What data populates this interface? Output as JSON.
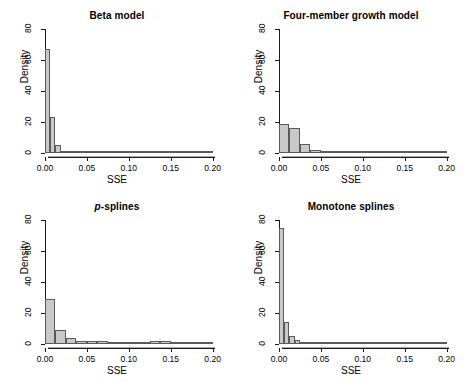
{
  "figure": {
    "panels": [
      {
        "id": "beta-model",
        "title": "Beta model",
        "title_italic_prefix": "",
        "xlabel": "SSE",
        "ylabel": "Density"
      },
      {
        "id": "four-member-growth-model",
        "title": "Four-member growth model",
        "title_italic_prefix": "",
        "xlabel": "SSE",
        "ylabel": "Density"
      },
      {
        "id": "p-splines",
        "title": "-splines",
        "title_italic_prefix": "p",
        "xlabel": "SSE",
        "ylabel": "Density"
      },
      {
        "id": "monotone-splines",
        "title": "Monotone splines",
        "title_italic_prefix": "",
        "xlabel": "SSE",
        "ylabel": "Density"
      }
    ],
    "axis": {
      "xticks": [
        0.0,
        0.05,
        0.1,
        0.15,
        0.2
      ],
      "xtick_labels": [
        "0.00",
        "0.05",
        "0.10",
        "0.15",
        "0.20"
      ],
      "yticks": [
        0,
        20,
        40,
        60,
        80
      ],
      "ytick_labels": [
        "0",
        "20",
        "40",
        "60",
        "80"
      ],
      "xlim": [
        0.0,
        0.21
      ],
      "ylim": [
        0,
        80
      ]
    },
    "colors": {
      "bar_fill": "#c9c9c9",
      "bar_border": "#5a5a5a",
      "axis": "#1a1a1a",
      "text": "#000000",
      "background": "#ffffff"
    }
  },
  "chart_data": [
    {
      "type": "bar",
      "title": "Beta model",
      "xlabel": "SSE",
      "ylabel": "Density",
      "xlim": [
        0.0,
        0.21
      ],
      "ylim": [
        0,
        80
      ],
      "grid": false,
      "legend": false,
      "bin_width": 0.00625,
      "bin_edges": [
        0.0,
        0.00625,
        0.0125,
        0.01875,
        0.025,
        0.03125,
        0.0375,
        0.04375,
        0.05,
        0.05625,
        0.0625,
        0.06875,
        0.075,
        0.08125,
        0.0875,
        0.09375,
        0.1,
        0.10625,
        0.1125,
        0.11875,
        0.125,
        0.13125,
        0.1375,
        0.14375,
        0.15,
        0.15625,
        0.1625,
        0.16875,
        0.175,
        0.18125,
        0.1875,
        0.19375,
        0.2
      ],
      "values": [
        67,
        23,
        5,
        1.5,
        1,
        0.8,
        0.5,
        0.4,
        0.3,
        0.3,
        0.3,
        0.2,
        0.2,
        0.4,
        0.5,
        0.4,
        0.3,
        0.2,
        0.4,
        0.5,
        0.3,
        0.2,
        0.2,
        0.1,
        0.2,
        0.1,
        0.1,
        0.1,
        0.1,
        0.1,
        0.1,
        0.1
      ]
    },
    {
      "type": "bar",
      "title": "Four-member growth model",
      "xlabel": "SSE",
      "ylabel": "Density",
      "xlim": [
        0.0,
        0.21
      ],
      "ylim": [
        0,
        80
      ],
      "grid": false,
      "legend": false,
      "bin_width": 0.0125,
      "bin_edges": [
        0.0,
        0.0125,
        0.025,
        0.0375,
        0.05,
        0.0625,
        0.075,
        0.0875,
        0.1,
        0.1125,
        0.125,
        0.1375,
        0.15,
        0.1625,
        0.175,
        0.1875,
        0.2
      ],
      "values": [
        18.5,
        16,
        6,
        2,
        1.1,
        1.0,
        1.0,
        0.9,
        0.9,
        0.8,
        0.6,
        0.7,
        0.9,
        0.9,
        0.6,
        0.4
      ]
    },
    {
      "type": "bar",
      "title": "p-splines",
      "xlabel": "SSE",
      "ylabel": "Density",
      "xlim": [
        0.0,
        0.21
      ],
      "ylim": [
        0,
        80
      ],
      "grid": false,
      "legend": false,
      "bin_width": 0.0125,
      "bin_edges": [
        0.0,
        0.0125,
        0.025,
        0.0375,
        0.05,
        0.0625,
        0.075,
        0.0875,
        0.1,
        0.1125,
        0.125,
        0.1375,
        0.15,
        0.1625,
        0.175,
        0.1875,
        0.2
      ],
      "values": [
        29,
        9,
        4,
        2.2,
        1.8,
        1.8,
        1.6,
        1.5,
        1.4,
        1.2,
        1.8,
        1.8,
        1.2,
        0.6,
        0.3,
        0.2
      ]
    },
    {
      "type": "bar",
      "title": "Monotone splines",
      "xlabel": "SSE",
      "ylabel": "Density",
      "xlim": [
        0.0,
        0.21
      ],
      "ylim": [
        0,
        80
      ],
      "grid": false,
      "legend": false,
      "bin_width": 0.00625,
      "bin_edges": [
        0.0,
        0.00625,
        0.0125,
        0.01875,
        0.025,
        0.03125,
        0.0375,
        0.04375,
        0.05,
        0.05625,
        0.0625,
        0.06875,
        0.075,
        0.08125,
        0.0875,
        0.09375,
        0.1,
        0.10625,
        0.1125,
        0.11875,
        0.125,
        0.13125,
        0.1375,
        0.14375,
        0.15,
        0.15625,
        0.1625,
        0.16875,
        0.175,
        0.18125,
        0.1875,
        0.19375,
        0.2
      ],
      "values": [
        75,
        14,
        5,
        2.5,
        0.8,
        0.5,
        0.4,
        0.4,
        0.3,
        0.3,
        0.3,
        0.3,
        0.4,
        0.3,
        0.3,
        0.4,
        0.3,
        0.2,
        0.2,
        0.2,
        0.3,
        0.4,
        0.3,
        0.2,
        0.2,
        0.2,
        0.2,
        0.1,
        0.1,
        0.1,
        0.1,
        0.1
      ]
    }
  ]
}
